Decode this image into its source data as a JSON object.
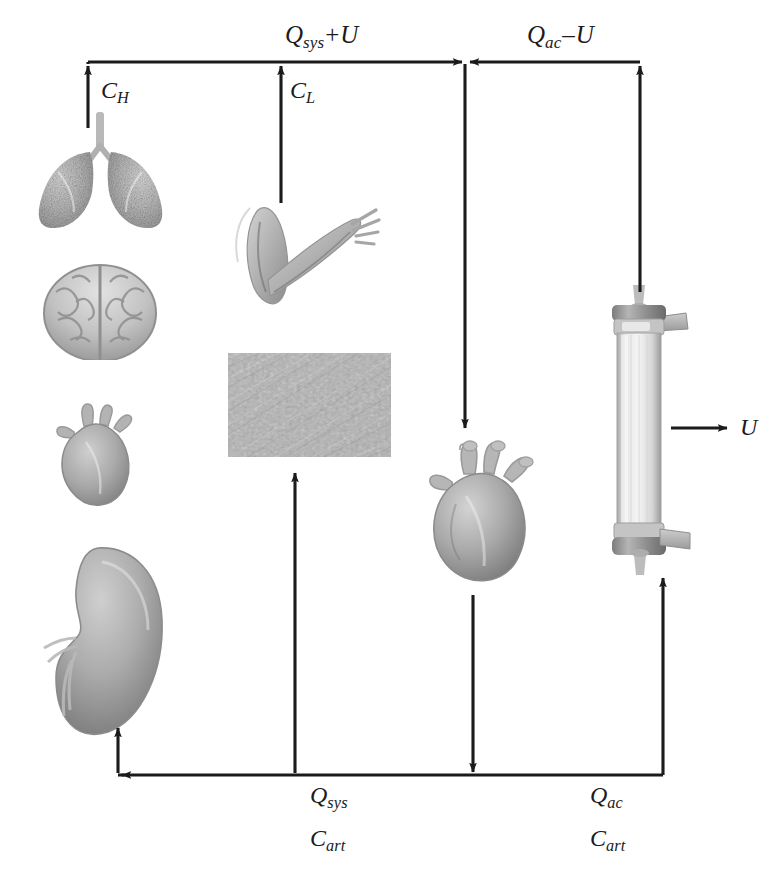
{
  "diagram": {
    "type": "flow-diagram",
    "background_color": "#ffffff",
    "line_color": "#1b1b1b",
    "label_color": "#1b1b1b"
  },
  "labels": {
    "q_sys_plus_u": {
      "base": "Q",
      "sub": "sys",
      "op": "+",
      "tail": "U",
      "x": 285,
      "y": 22,
      "text": "Qsys + U"
    },
    "q_ac_minus_u": {
      "base": "Q",
      "sub": "ac",
      "op": "–",
      "tail": "U",
      "x": 527,
      "y": 22,
      "text": "Qac – U"
    },
    "c_h": {
      "base": "C",
      "sub": "H",
      "x": 101,
      "y": 78,
      "text": "CH"
    },
    "c_l": {
      "base": "C",
      "sub": "L",
      "x": 290,
      "y": 78,
      "text": "CL"
    },
    "u_right": {
      "base": "U",
      "x": 740,
      "y": 418,
      "text": "U"
    },
    "q_sys": {
      "base": "Q",
      "sub": "sys",
      "x": 310,
      "y": 783,
      "text": "Qsys"
    },
    "c_art_left": {
      "base": "C",
      "sub": "art",
      "x": 310,
      "y": 826,
      "text": "Cart"
    },
    "q_ac": {
      "base": "Q",
      "sub": "ac",
      "x": 590,
      "y": 783,
      "text": "Qac"
    },
    "c_art_right": {
      "base": "C",
      "sub": "art",
      "x": 590,
      "y": 826,
      "text": "Cart"
    }
  },
  "organs": [
    {
      "name": "lungs",
      "icon": "lungs-image",
      "x": 28,
      "y": 112,
      "w": 145,
      "h": 115
    },
    {
      "name": "brain",
      "icon": "brain-image",
      "x": 36,
      "y": 258,
      "w": 128,
      "h": 100
    },
    {
      "name": "heart-left",
      "icon": "heart-image",
      "x": 48,
      "y": 402,
      "w": 100,
      "h": 110
    },
    {
      "name": "kidney",
      "icon": "kidney-image",
      "x": 36,
      "y": 542,
      "w": 136,
      "h": 200
    },
    {
      "name": "arm-muscle",
      "icon": "arm-image",
      "x": 222,
      "y": 200,
      "w": 160,
      "h": 125
    },
    {
      "name": "skin",
      "icon": "skin-texture",
      "x": 228,
      "y": 353,
      "w": 163,
      "h": 104
    },
    {
      "name": "heart-main",
      "icon": "heart-image",
      "x": 420,
      "y": 440,
      "w": 130,
      "h": 150
    },
    {
      "name": "dialyzer",
      "icon": "dialyzer-image",
      "x": 600,
      "y": 283,
      "w": 90,
      "h": 292
    }
  ],
  "connections": [
    {
      "name": "top-rail-left",
      "from": "lungs-top",
      "to": "center-junction",
      "direction": "right"
    },
    {
      "name": "c-h-arrow",
      "from": "lungs",
      "to": "top-rail",
      "direction": "up"
    },
    {
      "name": "c-l-arrow",
      "from": "arm-muscle",
      "to": "top-rail",
      "direction": "up"
    },
    {
      "name": "top-rail-right",
      "from": "dialyzer-top",
      "to": "center-junction",
      "direction": "left"
    },
    {
      "name": "dialyzer-return",
      "from": "dialyzer-top",
      "to": "top-rail",
      "direction": "up"
    },
    {
      "name": "junction-to-heart",
      "from": "center-junction",
      "to": "heart-main",
      "direction": "down"
    },
    {
      "name": "heart-to-bottom-rail",
      "from": "heart-main",
      "to": "bottom-rail",
      "direction": "down"
    },
    {
      "name": "bottom-rail-left",
      "from": "bottom-rail",
      "to": "kidney-column",
      "direction": "left"
    },
    {
      "name": "kidney-feed",
      "from": "bottom-rail",
      "to": "kidney",
      "direction": "up"
    },
    {
      "name": "q-sys-feed",
      "from": "bottom-rail",
      "to": "skin",
      "direction": "up"
    },
    {
      "name": "q-ac-feed",
      "from": "bottom-rail",
      "to": "dialyzer-bottom",
      "direction": "up"
    },
    {
      "name": "ultrafiltrate-out",
      "from": "dialyzer",
      "to": "outside",
      "direction": "right"
    }
  ]
}
